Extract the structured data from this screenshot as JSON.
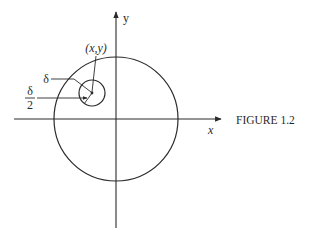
{
  "figure": {
    "caption": "FIGURE 1.2",
    "axis_x_label": "x",
    "axis_y_label": "y",
    "point_label": "(x,y)",
    "delta_label": "δ",
    "half_delta_numerator": "δ",
    "half_delta_denominator": "2",
    "stroke_color": "#2a2a2a"
  }
}
